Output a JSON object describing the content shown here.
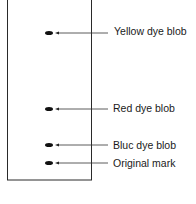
{
  "diagram": {
    "type": "chromatography-strip",
    "paper": {
      "x": 7,
      "y": -1,
      "width": 84,
      "height": 181
    },
    "blobs": [
      {
        "name": "yellow",
        "label": "Yellow dye blob",
        "y": 33
      },
      {
        "name": "red",
        "label": "Red dye blob",
        "y": 109
      },
      {
        "name": "blue",
        "label": "Bluc dye blob",
        "y": 145
      },
      {
        "name": "original",
        "label": "Original mark",
        "y": 163
      }
    ]
  }
}
